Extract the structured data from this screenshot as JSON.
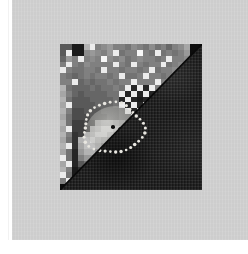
{
  "figure": {
    "kind": "image-panel",
    "caption": "",
    "background_color": "#cdcdcd",
    "gutter_color": "#ffffff",
    "panel": {
      "x": 12,
      "y": 0,
      "width": 236,
      "height": 240
    },
    "tile": {
      "name": "diagonal-split-comparison",
      "x": 60,
      "y": 44,
      "width": 142,
      "height": 146,
      "split": "anti-diagonal",
      "upper_left_label": "pixelated-mosaic",
      "lower_right_label": "original-dark",
      "dark_color": "#1d1d1d",
      "seam_color": "#0a0a0a"
    },
    "annotation": {
      "name": "face-contour",
      "style": "dotted-outline",
      "dot_color": "#e8e6e0",
      "dot_count": 34,
      "region": {
        "cx": 53,
        "cy": 84,
        "rx": 30,
        "ry": 25
      },
      "markers": [
        {
          "x": 61,
          "y": 86,
          "r": 3.4
        },
        {
          "x": 70,
          "y": 85,
          "r": 3.0
        },
        {
          "x": 64,
          "y": 95,
          "r": 2.4
        },
        {
          "x": 52,
          "y": 82,
          "r": 1.8
        }
      ]
    },
    "mosaic": {
      "name": "block-pixelation",
      "columns": 24,
      "rows": 25,
      "block_size_px": 6,
      "palette": [
        "#0d0d0d",
        "#1a1a1a",
        "#262626",
        "#333333",
        "#3f3f3f",
        "#4c4c4c",
        "#595959",
        "#666666",
        "#737373",
        "#808080",
        "#8c8c8c",
        "#999999",
        "#a6a6a6",
        "#b3b3b3",
        "#c0c0c0",
        "#d9d9d9",
        "#ececec",
        "#f7f7f7"
      ],
      "grid": [
        [
          6,
          6,
          1,
          1,
          13,
          16,
          9,
          10,
          11,
          9,
          9,
          8,
          10,
          9,
          8,
          10,
          8,
          9,
          7,
          9,
          10,
          12,
          0,
          0
        ],
        [
          6,
          16,
          1,
          1,
          10,
          11,
          10,
          9,
          11,
          16,
          8,
          9,
          9,
          17,
          9,
          8,
          16,
          8,
          9,
          8,
          9,
          11,
          0,
          0
        ],
        [
          7,
          11,
          9,
          16,
          9,
          10,
          9,
          17,
          10,
          9,
          10,
          8,
          9,
          10,
          9,
          9,
          8,
          9,
          16,
          9,
          9,
          10,
          10,
          9
        ],
        [
          9,
          16,
          9,
          8,
          10,
          9,
          9,
          9,
          9,
          16,
          9,
          8,
          16,
          9,
          8,
          9,
          9,
          16,
          8,
          9,
          10,
          9,
          9,
          9
        ],
        [
          16,
          9,
          8,
          8,
          9,
          9,
          8,
          16,
          9,
          9,
          8,
          9,
          9,
          8,
          9,
          16,
          8,
          9,
          9,
          10,
          16,
          9,
          9,
          9
        ],
        [
          9,
          8,
          7,
          8,
          9,
          8,
          9,
          9,
          8,
          9,
          16,
          8,
          8,
          9,
          16,
          9,
          9,
          8,
          9,
          9,
          9,
          9,
          9,
          8
        ],
        [
          9,
          9,
          16,
          7,
          8,
          7,
          8,
          8,
          9,
          8,
          9,
          9,
          16,
          9,
          9,
          9,
          16,
          9,
          9,
          8,
          9,
          16,
          9,
          8
        ],
        [
          13,
          8,
          7,
          7,
          7,
          8,
          7,
          8,
          8,
          9,
          8,
          16,
          2,
          16,
          2,
          16,
          9,
          9,
          8,
          9,
          9,
          9,
          8,
          8
        ],
        [
          12,
          9,
          7,
          6,
          7,
          7,
          7,
          7,
          8,
          8,
          16,
          2,
          16,
          2,
          16,
          2,
          16,
          8,
          9,
          9,
          8,
          9,
          8,
          7
        ],
        [
          13,
          8,
          6,
          6,
          6,
          7,
          7,
          7,
          7,
          8,
          2,
          16,
          2,
          1,
          2,
          16,
          2,
          9,
          8,
          8,
          9,
          8,
          8,
          7
        ],
        [
          12,
          16,
          6,
          6,
          6,
          6,
          7,
          7,
          7,
          8,
          16,
          2,
          16,
          2,
          16,
          2,
          8,
          8,
          8,
          8,
          8,
          8,
          7,
          7
        ],
        [
          13,
          9,
          5,
          5,
          6,
          6,
          6,
          7,
          7,
          7,
          8,
          16,
          2,
          16,
          2,
          8,
          8,
          8,
          7,
          8,
          7,
          7,
          7,
          7
        ],
        [
          12,
          8,
          5,
          5,
          5,
          6,
          6,
          6,
          7,
          7,
          8,
          8,
          16,
          8,
          8,
          7,
          8,
          7,
          7,
          7,
          7,
          7,
          6,
          6
        ],
        [
          13,
          8,
          4,
          4,
          5,
          5,
          12,
          13,
          13,
          12,
          11,
          8,
          7,
          7,
          7,
          7,
          7,
          7,
          7,
          6,
          6,
          6,
          6,
          6
        ],
        [
          12,
          16,
          4,
          4,
          4,
          13,
          14,
          15,
          15,
          14,
          13,
          11,
          8,
          7,
          7,
          7,
          6,
          6,
          6,
          6,
          6,
          6,
          5,
          5
        ],
        [
          13,
          9,
          3,
          4,
          13,
          14,
          15,
          15,
          14,
          13,
          12,
          10,
          8,
          7,
          6,
          6,
          6,
          6,
          6,
          5,
          5,
          5,
          5,
          5
        ],
        [
          12,
          8,
          3,
          13,
          14,
          15,
          14,
          13,
          12,
          11,
          10,
          9,
          7,
          6,
          6,
          6,
          5,
          5,
          5,
          5,
          5,
          4,
          4,
          4
        ],
        [
          13,
          16,
          3,
          12,
          14,
          14,
          13,
          11,
          9,
          8,
          9,
          8,
          6,
          6,
          5,
          5,
          5,
          5,
          4,
          4,
          4,
          4,
          4,
          4
        ],
        [
          12,
          8,
          2,
          11,
          13,
          13,
          11,
          9,
          7,
          6,
          7,
          7,
          5,
          5,
          5,
          4,
          4,
          4,
          4,
          4,
          3,
          3,
          3,
          3
        ],
        [
          16,
          8,
          2,
          9,
          11,
          11,
          9,
          7,
          6,
          5,
          6,
          5,
          4,
          4,
          4,
          4,
          3,
          3,
          3,
          3,
          3,
          3,
          3,
          3
        ],
        [
          12,
          16,
          2,
          6,
          8,
          9,
          8,
          6,
          5,
          4,
          4,
          4,
          3,
          3,
          3,
          3,
          3,
          3,
          2,
          2,
          2,
          2,
          2,
          2
        ],
        [
          13,
          9,
          1,
          3,
          5,
          6,
          5,
          4,
          3,
          3,
          3,
          3,
          2,
          2,
          2,
          2,
          2,
          2,
          2,
          2,
          2,
          2,
          2,
          2
        ],
        [
          16,
          8,
          1,
          2,
          3,
          3,
          3,
          2,
          2,
          2,
          2,
          2,
          2,
          2,
          2,
          2,
          1,
          1,
          1,
          1,
          1,
          1,
          1,
          1
        ],
        [
          9,
          16,
          1,
          1,
          2,
          2,
          2,
          2,
          1,
          1,
          1,
          1,
          1,
          1,
          1,
          1,
          1,
          1,
          1,
          1,
          1,
          1,
          1,
          1
        ],
        [
          0,
          9,
          1,
          1,
          1,
          1,
          1,
          1,
          1,
          1,
          1,
          1,
          1,
          1,
          1,
          1,
          1,
          1,
          1,
          1,
          1,
          1,
          1,
          1
        ]
      ]
    }
  }
}
